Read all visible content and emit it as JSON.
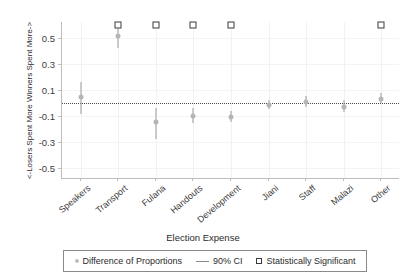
{
  "chart_data": {
    "type": "scatter",
    "title": "",
    "xlabel": "Election Expense",
    "ylabel": "<-Losers Spent More     Winners Spent More->",
    "categories": [
      "Speakers",
      "Transport",
      "Fulana",
      "Handouts",
      "Development",
      "Jiani",
      "Staff",
      "Malazi",
      "Other"
    ],
    "ylim": [
      -0.58,
      0.62
    ],
    "yticks": [
      0.5,
      0.3,
      0.1,
      -0.1,
      -0.3,
      -0.5
    ],
    "ytick_labels": [
      "0.5",
      "0.3",
      "0.1",
      "-0.1",
      "-0.3",
      "-0.5"
    ],
    "grid": true,
    "zero_reference_line": 0,
    "legend_position": "bottom",
    "series": [
      {
        "name": "Difference of Proportions",
        "values": [
          0.04,
          0.51,
          -0.15,
          -0.1,
          -0.11,
          -0.015,
          0.005,
          -0.03,
          0.03
        ]
      },
      {
        "name": "90% CI lower",
        "values": [
          -0.09,
          0.42,
          -0.28,
          -0.155,
          -0.15,
          -0.05,
          -0.035,
          -0.075,
          0.0
        ]
      },
      {
        "name": "90% CI upper",
        "values": [
          0.16,
          0.6,
          -0.045,
          -0.045,
          -0.065,
          0.02,
          0.05,
          0.02,
          0.075
        ]
      }
    ],
    "significant": [
      false,
      true,
      true,
      true,
      true,
      false,
      false,
      false,
      true
    ],
    "significance_marker_y": 0.6
  },
  "legend": {
    "items": [
      {
        "label": "Difference of Proportions",
        "marker": "dot-icon",
        "color": "#bdbdbd"
      },
      {
        "label": "90% CI",
        "marker": "line-icon",
        "color": "#8a8a8a"
      },
      {
        "label": "Statistically Significant",
        "marker": "square-icon",
        "color": "#3a3a3a"
      }
    ]
  }
}
